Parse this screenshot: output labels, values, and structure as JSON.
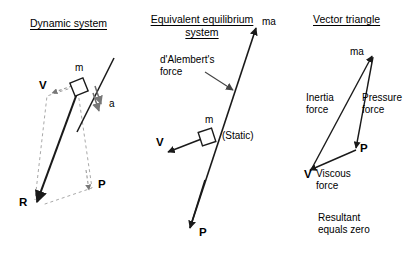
{
  "figure": {
    "background": "#ffffff",
    "ink": "#1a1a1a",
    "dashed_ink": "#9a9a9a"
  },
  "panels": [
    {
      "id": "dynamic-system",
      "title": "Dynamic system",
      "labels": {
        "mass": "m",
        "velocity": "V",
        "acceleration": "a",
        "pressure": "P",
        "resultant": "R"
      }
    },
    {
      "id": "equivalent-equilibrium-system",
      "title_line1": "Equivalent equilibrium",
      "title_line2": "system",
      "labels": {
        "ma": "ma",
        "dalembert_line1": "d'Alembert's",
        "dalembert_line2": "force",
        "mass": "m",
        "velocity": "V",
        "static": "(Static)",
        "pressure": "P"
      }
    },
    {
      "id": "vector-triangle",
      "title": "Vector triangle",
      "labels": {
        "ma": "ma",
        "inertia_line1": "Inertia",
        "inertia_line2": "force",
        "pressure_line1": "Pressure",
        "pressure_line2": "force",
        "pressure_vec": "P",
        "viscous_vec": "V",
        "viscous_line1": "Viscous",
        "viscous_line2": "force",
        "note_line1": "Resultant",
        "note_line2": "equals zero"
      }
    }
  ]
}
